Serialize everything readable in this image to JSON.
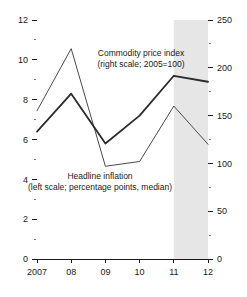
{
  "chart_data": {
    "type": "line",
    "title": "",
    "subtitle": "",
    "xlabel": "",
    "ylabel": "",
    "grid": false,
    "legend_position": "inline-annotations",
    "x": [
      "2007",
      "08",
      "09",
      "10",
      "11",
      "12"
    ],
    "xtick_labels": [
      "2007",
      "08",
      "09",
      "10",
      "11",
      "12"
    ],
    "left_axis": {
      "label": "percentage points, median",
      "ylim": [
        0,
        12
      ],
      "major_ticks": [
        0,
        2,
        4,
        6,
        8,
        10,
        12
      ],
      "major_tick_labels": [
        "0",
        "2",
        "4",
        "6",
        "8",
        "10",
        "12"
      ],
      "minor_ticks": [
        1,
        3,
        5,
        7,
        9,
        11
      ]
    },
    "right_axis": {
      "label": "2005=100",
      "ylim": [
        0,
        250
      ],
      "major_ticks": [
        0,
        50,
        100,
        150,
        200,
        250
      ],
      "major_tick_labels": [
        "0",
        "50",
        "100",
        "150",
        "200",
        "250"
      ],
      "minor_ticks": [
        25,
        75,
        125,
        175,
        225
      ]
    },
    "series": [
      {
        "name": "Headline inflation",
        "axis": "left",
        "style": "thick",
        "values": [
          6.4,
          8.3,
          5.8,
          7.2,
          9.2,
          8.9
        ]
      },
      {
        "name": "Commodity price index",
        "axis": "right",
        "style": "thin",
        "values": [
          155,
          220,
          97,
          102,
          160,
          120
        ]
      }
    ],
    "shaded_region": {
      "from": "11",
      "to": "12",
      "color": "#e6e6e6",
      "meaning": "projection"
    },
    "annotations": [
      {
        "name": "commodity-price-index-annotation",
        "lines": [
          "Commodity price index",
          "(right scale; 2005=100)"
        ]
      },
      {
        "name": "headline-inflation-annotation",
        "lines": [
          "Headline inflation",
          "(left scale; percentage points, median)"
        ]
      }
    ]
  },
  "colors": {
    "axis": "#1a1a1a",
    "series_thick": "#2b2b2b",
    "series_thin": "#4a4a4a",
    "shade": "#e6e6e6",
    "background": "#ffffff"
  }
}
